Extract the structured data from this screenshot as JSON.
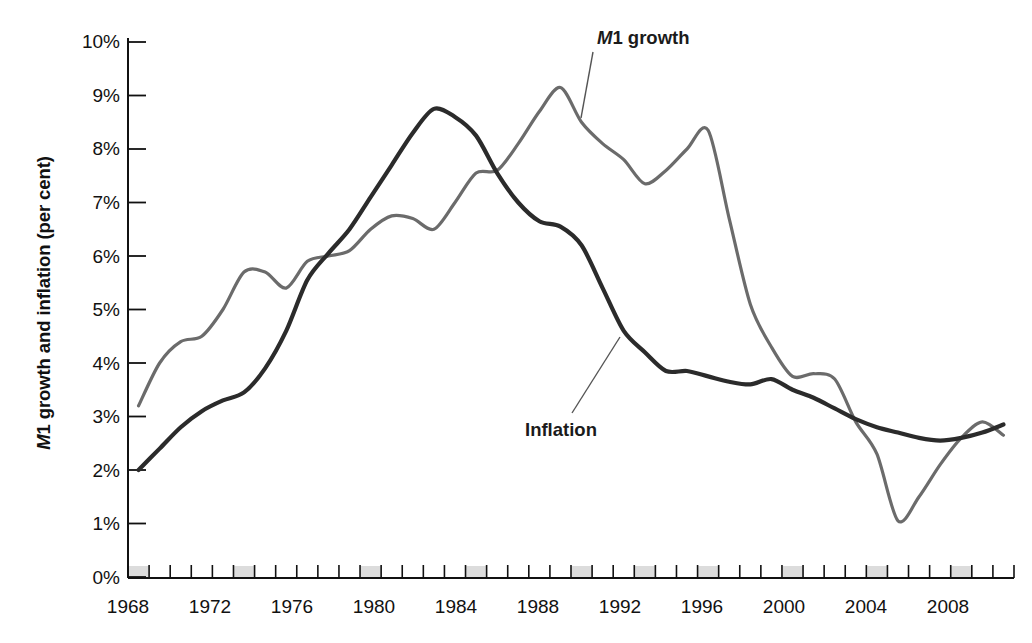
{
  "chart_data": {
    "type": "line",
    "title": "",
    "xlabel": "",
    "ylabel": "M1 growth and inflation (per cent)",
    "ylabel_italic_prefix": "M",
    "ylabel_rest": "1 growth and inflation (per cent)",
    "xlim": [
      1968,
      2009
    ],
    "ylim": [
      0,
      10
    ],
    "y_tick_labels": [
      "10%",
      "9%",
      "8%",
      "7%",
      "6%",
      "5%",
      "4%",
      "3%",
      "2%",
      "1%",
      "0%"
    ],
    "y_tick_values": [
      10,
      9,
      8,
      7,
      6,
      5,
      4,
      3,
      2,
      1,
      0
    ],
    "x_tick_labels": [
      "1968",
      "1972",
      "1976",
      "1980",
      "1984",
      "1988",
      "1992",
      "1996",
      "2000",
      "2004",
      "2008"
    ],
    "x_tick_values": [
      1968,
      1972,
      1976,
      1980,
      1984,
      1988,
      1992,
      1996,
      2000,
      2004,
      2008
    ],
    "x_minor_tick_step": 1,
    "grid": false,
    "legend_position": "inline-annotations",
    "shaded_bands_label": "recession-bands",
    "shaded_band_years": [
      1968,
      1973,
      1979,
      1984,
      1989,
      1992,
      1995,
      1999,
      2003,
      2007
    ],
    "series": [
      {
        "name": "M1 growth",
        "color": "#6b6b6b",
        "x": [
          1968,
          1969,
          1970,
          1971,
          1972,
          1973,
          1974,
          1975,
          1976,
          1977,
          1978,
          1979,
          1980,
          1981,
          1982,
          1983,
          1984,
          1985,
          1986,
          1987,
          1988,
          1989,
          1990,
          1991,
          1992,
          1993,
          1994,
          1995,
          1996,
          1997,
          1998,
          1999,
          2000,
          2001,
          2002,
          2003,
          2004,
          2005,
          2006,
          2007,
          2008,
          2009
        ],
        "values": [
          3.2,
          4.0,
          4.4,
          4.5,
          5.0,
          5.7,
          5.7,
          5.4,
          5.9,
          6.0,
          6.1,
          6.5,
          6.75,
          6.7,
          6.5,
          7.0,
          7.55,
          7.6,
          8.1,
          8.7,
          9.15,
          8.5,
          8.1,
          7.8,
          7.35,
          7.6,
          8.0,
          8.35,
          6.7,
          5.1,
          4.3,
          3.75,
          3.8,
          3.7,
          2.9,
          2.3,
          1.05,
          1.5,
          2.1,
          2.6,
          2.9,
          2.65
        ]
      },
      {
        "name": "Inflation",
        "color": "#2b2b2b",
        "x": [
          1968,
          1969,
          1970,
          1971,
          1972,
          1973,
          1974,
          1975,
          1976,
          1977,
          1978,
          1979,
          1980,
          1981,
          1982,
          1983,
          1984,
          1985,
          1986,
          1987,
          1988,
          1989,
          1990,
          1991,
          1992,
          1993,
          1994,
          1995,
          1996,
          1997,
          1998,
          1999,
          2000,
          2001,
          2002,
          2003,
          2004,
          2005,
          2006,
          2007,
          2008,
          2009
        ],
        "values": [
          2.0,
          2.4,
          2.8,
          3.1,
          3.3,
          3.45,
          3.9,
          4.6,
          5.55,
          6.05,
          6.5,
          7.1,
          7.7,
          8.3,
          8.75,
          8.6,
          8.25,
          7.55,
          7.0,
          6.65,
          6.55,
          6.2,
          5.4,
          4.6,
          4.2,
          3.85,
          3.85,
          3.75,
          3.65,
          3.6,
          3.7,
          3.5,
          3.35,
          3.15,
          2.95,
          2.8,
          2.7,
          2.6,
          2.55,
          2.6,
          2.7,
          2.85
        ]
      }
    ],
    "annotations": [
      {
        "name": "m1-growth-annotation",
        "text": "M1 growth",
        "italic_prefix": "M",
        "rest": "1 growth"
      },
      {
        "name": "inflation-annotation",
        "text": "Inflation",
        "italic_prefix": "",
        "rest": "Inflation"
      }
    ]
  },
  "axes": {
    "y_axis_title": "M1 growth and inflation (per cent)"
  }
}
